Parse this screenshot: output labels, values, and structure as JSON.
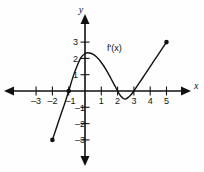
{
  "figure": {
    "title": "",
    "curve_label": "f'(x)",
    "x_axis_name": "x",
    "y_axis_name": "y"
  },
  "chart_data": {
    "type": "line",
    "title": "",
    "xlabel": "x",
    "ylabel": "y",
    "grid": false,
    "legend": "none",
    "xlim": [
      -3.8,
      6.0
    ],
    "ylim": [
      -3.8,
      4.2
    ],
    "xticks": [
      -3,
      -2,
      -1,
      1,
      2,
      3,
      4,
      5
    ],
    "xtick_labels": [
      "–3",
      "–2",
      "–1",
      "1",
      "2",
      "3",
      "4",
      "5"
    ],
    "yticks": [
      3,
      2,
      1,
      -1,
      -2,
      -3
    ],
    "ytick_labels": [
      "3",
      "2",
      "1",
      "–1",
      "–2",
      "–3"
    ],
    "series": [
      {
        "name": "f'(x)",
        "label": "f'(x)",
        "color": "#111111",
        "x": [
          -2.0,
          -1.75,
          -1.5,
          -1.25,
          -1.0,
          -0.75,
          -0.5,
          -0.25,
          0.0,
          0.15,
          0.4,
          0.7,
          1.0,
          1.3,
          1.6,
          1.8,
          2.0,
          2.2,
          2.45,
          2.7,
          2.85,
          3.0,
          3.3,
          3.7,
          4.1,
          4.5,
          5.0
        ],
        "y": [
          -3.0,
          -2.25,
          -1.5,
          -0.78,
          0.0,
          0.82,
          1.5,
          2.05,
          2.3,
          2.35,
          2.3,
          2.1,
          1.75,
          1.3,
          0.75,
          0.38,
          0.0,
          -0.32,
          -0.5,
          -0.35,
          -0.2,
          0.0,
          0.45,
          1.05,
          1.65,
          2.25,
          3.0
        ]
      }
    ],
    "endpoints": [
      {
        "name": "left-endpoint",
        "x": -2.0,
        "y": -3.0,
        "filled": true
      },
      {
        "name": "right-endpoint",
        "x": 5.0,
        "y": 3.0,
        "filled": true
      }
    ],
    "marked_points": [
      {
        "name": "x-intercept-neg-one",
        "x": -1.0,
        "y": 0.0,
        "filled": true
      }
    ],
    "annotations": [
      {
        "name": "curve-label",
        "text": "f'(x)",
        "x": 1.35,
        "y": 2.45
      }
    ]
  }
}
